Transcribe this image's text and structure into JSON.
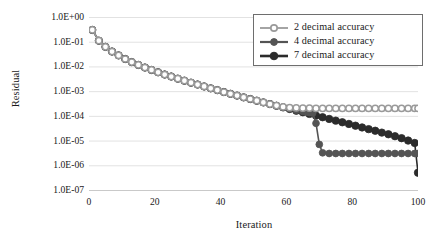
{
  "chart_data": {
    "type": "line",
    "title": "",
    "xlabel": "Iteration",
    "ylabel": "Residual",
    "xlim": [
      0,
      100
    ],
    "ylim": [
      1e-07,
      1.0
    ],
    "yscale": "log",
    "grid": "horizontal",
    "legend_position": "top-right",
    "xticks": [
      "0",
      "20",
      "40",
      "60",
      "80",
      "100"
    ],
    "xtick_values": [
      0,
      20,
      40,
      60,
      80,
      100
    ],
    "yticks": [
      "1.0E+00",
      "1.0E-01",
      "1.0E-02",
      "1.0E-03",
      "1.0E-04",
      "1.0E-05",
      "1.0E-06",
      "1.0E-07"
    ],
    "ytick_values": [
      1.0,
      0.1,
      0.01,
      0.001,
      0.0001,
      1e-05,
      1e-06,
      1e-07
    ],
    "series": [
      {
        "name": "2 decimal accuracy",
        "color": "#9a9a9a",
        "marker": "circle-open",
        "marker_size": 3.1,
        "x": [
          1,
          3,
          5,
          7,
          9,
          11,
          13,
          15,
          17,
          19,
          21,
          23,
          25,
          27,
          29,
          31,
          33,
          35,
          37,
          39,
          41,
          43,
          45,
          47,
          49,
          51,
          53,
          55,
          57,
          59,
          61,
          63,
          65,
          67,
          69,
          71,
          73,
          75,
          77,
          79,
          81,
          83,
          85,
          87,
          89,
          91,
          93,
          95,
          97,
          99,
          100
        ],
        "y": [
          0.3,
          0.11,
          0.062,
          0.04,
          0.028,
          0.02,
          0.015,
          0.0115,
          0.009,
          0.0072,
          0.0058,
          0.0047,
          0.0039,
          0.0032,
          0.00265,
          0.0022,
          0.00185,
          0.00155,
          0.0013,
          0.0011,
          0.00092,
          0.00078,
          0.00066,
          0.00056,
          0.00048,
          0.00041,
          0.00035,
          0.0003,
          0.00026,
          0.00023,
          0.000215,
          0.00021,
          0.000205,
          0.000205,
          0.0002,
          0.0002,
          0.0002,
          0.0002,
          0.0002,
          0.0002,
          0.0002,
          0.0002,
          0.0002,
          0.0002,
          0.0002,
          0.0002,
          0.0002,
          0.0002,
          0.0002,
          0.0002,
          0.0002
        ]
      },
      {
        "name": "4 decimal accuracy",
        "color": "#545454",
        "marker": "circle-filled",
        "marker_size": 3.4,
        "x": [
          1,
          3,
          5,
          7,
          9,
          11,
          13,
          15,
          17,
          19,
          21,
          23,
          25,
          27,
          29,
          31,
          33,
          35,
          37,
          39,
          41,
          43,
          45,
          47,
          49,
          51,
          53,
          55,
          57,
          59,
          61,
          63,
          65,
          66,
          67,
          68,
          69,
          70,
          71,
          73,
          75,
          77,
          79,
          81,
          83,
          85,
          87,
          89,
          91,
          93,
          95,
          97,
          99,
          100
        ],
        "y": [
          0.3,
          0.11,
          0.062,
          0.04,
          0.028,
          0.02,
          0.015,
          0.0115,
          0.009,
          0.0072,
          0.0058,
          0.0047,
          0.0039,
          0.0032,
          0.00265,
          0.0022,
          0.00185,
          0.00155,
          0.0013,
          0.0011,
          0.00092,
          0.00078,
          0.00066,
          0.00056,
          0.00048,
          0.00041,
          0.00035,
          0.0003,
          0.00026,
          0.000225,
          0.000195,
          0.00017,
          0.00015,
          0.000142,
          0.000135,
          0.00013,
          5e-05,
          7e-06,
          3.2e-06,
          3e-06,
          3e-06,
          3e-06,
          3e-06,
          3e-06,
          3e-06,
          3e-06,
          3e-06,
          3e-06,
          3e-06,
          3e-06,
          3e-06,
          3e-06,
          3e-06,
          3e-06
        ]
      },
      {
        "name": "7 decimal accuracy",
        "color": "#2b2b2b",
        "marker": "circle-filled",
        "marker_size": 3.7,
        "x": [
          1,
          3,
          5,
          7,
          9,
          11,
          13,
          15,
          17,
          19,
          21,
          23,
          25,
          27,
          29,
          31,
          33,
          35,
          37,
          39,
          41,
          43,
          45,
          47,
          49,
          51,
          53,
          55,
          57,
          59,
          61,
          63,
          65,
          67,
          69,
          71,
          73,
          75,
          77,
          79,
          81,
          83,
          85,
          87,
          89,
          91,
          93,
          95,
          97,
          99,
          100
        ],
        "y": [
          0.3,
          0.11,
          0.062,
          0.04,
          0.028,
          0.02,
          0.015,
          0.0115,
          0.009,
          0.0072,
          0.0058,
          0.0047,
          0.0039,
          0.0032,
          0.00265,
          0.0022,
          0.00185,
          0.00155,
          0.0013,
          0.0011,
          0.00092,
          0.00078,
          0.00066,
          0.00056,
          0.00048,
          0.00041,
          0.00035,
          0.0003,
          0.000255,
          0.00022,
          0.00019,
          0.000162,
          0.00014,
          0.00012,
          0.000102,
          8.8e-05,
          7.5e-05,
          6.4e-05,
          5.5e-05,
          4.7e-05,
          4e-05,
          3.4e-05,
          2.9e-05,
          2.5e-05,
          2.1e-05,
          1.8e-05,
          1.5e-05,
          1.25e-05,
          1e-05,
          8e-06,
          5e-07
        ]
      }
    ]
  },
  "legend": {
    "items": [
      {
        "label": "2 decimal accuracy"
      },
      {
        "label": "4 decimal accuracy"
      },
      {
        "label": "7 decimal accuracy"
      }
    ]
  }
}
